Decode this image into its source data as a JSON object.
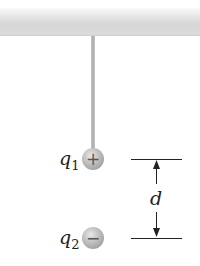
{
  "diagram": {
    "charge1": {
      "symbol": "q",
      "subscript": "1",
      "sign": "+"
    },
    "charge2": {
      "symbol": "q",
      "subscript": "2",
      "sign": "−"
    },
    "distance_label": "d"
  }
}
